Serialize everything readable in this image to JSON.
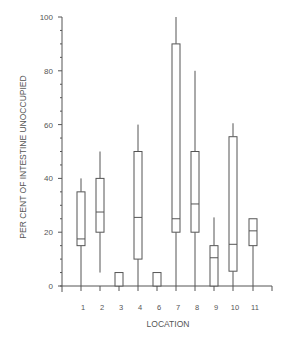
{
  "chart_data": {
    "type": "boxplot",
    "title": "",
    "xlabel": "LOCATION",
    "ylabel": "PER CENT OF INTESTINE UNOCCUPIED",
    "ylim": [
      0,
      100
    ],
    "yticks_major": [
      0,
      20,
      40,
      60,
      80,
      100
    ],
    "ytick_minor_step": 5,
    "grid": false,
    "legend": null,
    "categories": [
      "1",
      "2",
      "3",
      "4",
      "6",
      "7",
      "8",
      "9",
      "10",
      "11"
    ],
    "series": [
      {
        "name": "Per cent unoccupied",
        "boxes": [
          {
            "location": "1",
            "whisker_low": 0,
            "q1": 15,
            "median": 17.5,
            "q3": 35,
            "whisker_high": 40
          },
          {
            "location": "2",
            "whisker_low": 5,
            "q1": 20,
            "median": 27.5,
            "q3": 40,
            "whisker_high": 50
          },
          {
            "location": "3",
            "whisker_low": 0,
            "q1": 0,
            "median": 0,
            "q3": 5,
            "whisker_high": 5
          },
          {
            "location": "4",
            "whisker_low": 0,
            "q1": 10,
            "median": 25.5,
            "q3": 50,
            "whisker_high": 60
          },
          {
            "location": "6",
            "whisker_low": 0,
            "q1": 0,
            "median": 0,
            "q3": 5,
            "whisker_high": 5
          },
          {
            "location": "7",
            "whisker_low": 0,
            "q1": 20,
            "median": 25,
            "q3": 90,
            "whisker_high": 100
          },
          {
            "location": "8",
            "whisker_low": 0,
            "q1": 20,
            "median": 30.5,
            "q3": 50,
            "whisker_high": 80
          },
          {
            "location": "9",
            "whisker_low": 0,
            "q1": 0,
            "median": 10.5,
            "q3": 15,
            "whisker_high": 25.5
          },
          {
            "location": "10",
            "whisker_low": 0,
            "q1": 5.5,
            "median": 15.5,
            "q3": 55.5,
            "whisker_high": 60.5
          },
          {
            "location": "11",
            "whisker_low": 0,
            "q1": 15,
            "median": 20.5,
            "q3": 25,
            "whisker_high": 25
          }
        ]
      }
    ]
  },
  "layout": {
    "y_zero_px": 286,
    "px_per_unit": 2.69,
    "x_axis_left": 60,
    "x_axis_right": 272,
    "y_axis_x": 62,
    "tick_x": [
      81,
      100,
      119,
      138,
      157,
      176,
      195,
      214,
      233,
      253,
      272
    ],
    "box_half_width": 4,
    "line_color": "#555555"
  }
}
